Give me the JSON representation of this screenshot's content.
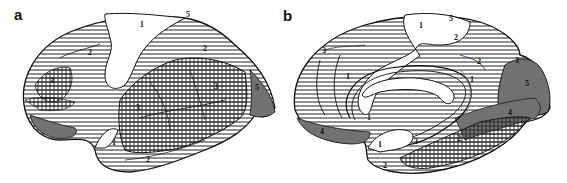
{
  "figure": {
    "panels": [
      {
        "id": "a",
        "letter": "a",
        "view": "lateral hemisphere",
        "zone_labels": [
          "1",
          "2",
          "3",
          "4",
          "5",
          "1",
          "2",
          "3",
          "1",
          "2",
          "3",
          "5",
          "5",
          "2",
          "4"
        ]
      },
      {
        "id": "b",
        "letter": "b",
        "view": "medial hemisphere",
        "zone_labels": [
          "1",
          "5",
          "2",
          "3",
          "2",
          "1",
          "1",
          "5",
          "3",
          "5",
          "4",
          "1",
          "4",
          "1",
          "3",
          "2",
          "2",
          "1"
        ]
      }
    ],
    "legend_patterns": {
      "1": "blank (white)",
      "2": "horizontal hatching",
      "3": "cross hatching",
      "4": "dense vertical hatching",
      "5": "dense stipple/vertical"
    },
    "colors": {
      "ink": "#111111",
      "paper": "#ffffff"
    }
  }
}
